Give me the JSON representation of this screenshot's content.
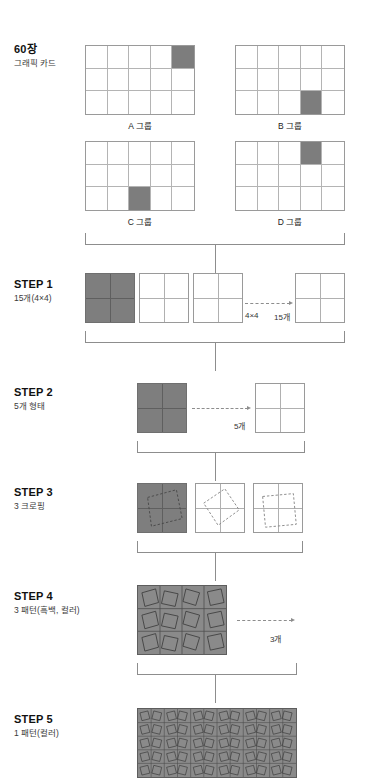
{
  "diagram": {
    "source": {
      "title": "60장",
      "subtitle": "그래픽 카드",
      "cards": [
        {
          "caption": "A 그룹",
          "cols": 5,
          "rows": 3,
          "filled_cell": {
            "row": 1,
            "col": 5
          }
        },
        {
          "caption": "B 그룹",
          "cols": 5,
          "rows": 3,
          "filled_cell": {
            "row": 3,
            "col": 4
          }
        },
        {
          "caption": "C 그룹",
          "cols": 5,
          "rows": 3,
          "filled_cell": {
            "row": 3,
            "col": 3
          }
        },
        {
          "caption": "D 그룹",
          "cols": 5,
          "rows": 3,
          "filled_cell": {
            "row": 1,
            "col": 4
          }
        }
      ]
    },
    "steps": [
      {
        "id": "step1",
        "title": "STEP 1",
        "subtitle": "15개(4×4)",
        "note_left": "4×4",
        "note_right": "15개",
        "squares": 4
      },
      {
        "id": "step2",
        "title": "STEP 2",
        "subtitle": "5개 형태",
        "note_right": "5개",
        "squares": 2
      },
      {
        "id": "step3",
        "title": "STEP 3",
        "subtitle": "3 크로핑",
        "squares": 3
      },
      {
        "id": "step4",
        "title": "STEP 4",
        "subtitle": "3 패턴(흑백, 컬러)",
        "note_right": "3개",
        "tiles_x": 4,
        "tiles_y": 3
      },
      {
        "id": "step5",
        "title": "STEP 5",
        "subtitle": "1 패턴(컬러)",
        "tiles_x": 12,
        "tiles_y": 5
      }
    ],
    "colors": {
      "fill_gray": "#7d7d7d",
      "pattern_gray": "#8a8a8a",
      "line_gray": "#8d8d8d",
      "border_gray": "#9a9a9a"
    }
  }
}
